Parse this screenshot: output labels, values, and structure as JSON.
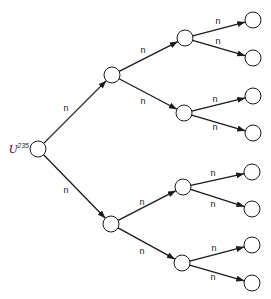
{
  "diagram": {
    "title": "",
    "type": "tree",
    "root": {
      "label": "U",
      "superscript": "235",
      "x": 38,
      "y": 149
    },
    "node_radius": 8,
    "nodes": [
      {
        "id": "root",
        "x": 38,
        "y": 149
      },
      {
        "id": "a",
        "x": 112,
        "y": 75
      },
      {
        "id": "b",
        "x": 111,
        "y": 224
      },
      {
        "id": "a1",
        "x": 185,
        "y": 38
      },
      {
        "id": "a2",
        "x": 184,
        "y": 113
      },
      {
        "id": "b1",
        "x": 183,
        "y": 187
      },
      {
        "id": "b2",
        "x": 182,
        "y": 263
      },
      {
        "id": "a1a",
        "x": 253,
        "y": 20
      },
      {
        "id": "a1b",
        "x": 253,
        "y": 58
      },
      {
        "id": "a2a",
        "x": 253,
        "y": 96
      },
      {
        "id": "a2b",
        "x": 253,
        "y": 133
      },
      {
        "id": "b1a",
        "x": 252,
        "y": 172
      },
      {
        "id": "b1b",
        "x": 252,
        "y": 209
      },
      {
        "id": "b2a",
        "x": 252,
        "y": 245
      },
      {
        "id": "b2b",
        "x": 252,
        "y": 283
      }
    ],
    "edges": [
      {
        "from": "root",
        "to": "a",
        "label": "n",
        "lx": 66,
        "ly": 111
      },
      {
        "from": "root",
        "to": "b",
        "label": "n",
        "lx": 66,
        "ly": 193
      },
      {
        "from": "a",
        "to": "a1",
        "label": "n",
        "lx": 143,
        "ly": 53
      },
      {
        "from": "a",
        "to": "a2",
        "label": "n",
        "lx": 143,
        "ly": 104
      },
      {
        "from": "b",
        "to": "b1",
        "label": "n",
        "lx": 142,
        "ly": 205
      },
      {
        "from": "b",
        "to": "b2",
        "label": "n",
        "lx": 142,
        "ly": 254
      },
      {
        "from": "a1",
        "to": "a1a",
        "label": "n",
        "lx": 218,
        "ly": 24
      },
      {
        "from": "a1",
        "to": "a1b",
        "label": "n",
        "lx": 218,
        "ly": 44
      },
      {
        "from": "a2",
        "to": "a2a",
        "label": "n",
        "lx": 215,
        "ly": 102
      },
      {
        "from": "a2",
        "to": "a2b",
        "label": "n",
        "lx": 215,
        "ly": 130
      },
      {
        "from": "b1",
        "to": "b1a",
        "label": "n",
        "lx": 213,
        "ly": 176
      },
      {
        "from": "b1",
        "to": "b1b",
        "label": "n",
        "lx": 213,
        "ly": 207
      },
      {
        "from": "b2",
        "to": "b2a",
        "label": "n",
        "lx": 214,
        "ly": 251
      },
      {
        "from": "b2",
        "to": "b2b",
        "label": "n",
        "lx": 213,
        "ly": 280
      }
    ]
  }
}
